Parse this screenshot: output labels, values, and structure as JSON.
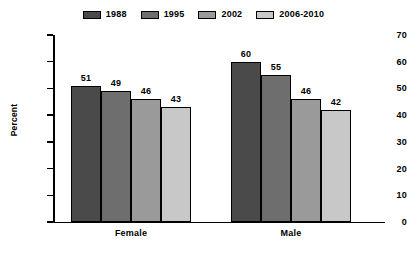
{
  "chart_data": {
    "type": "bar",
    "title": "",
    "xlabel": "",
    "ylabel": "Percent",
    "ylim": [
      0,
      70
    ],
    "ytick_step": 10,
    "yticks": [
      0,
      10,
      20,
      30,
      40,
      50,
      60,
      70
    ],
    "grid": false,
    "legend_position": "top-center",
    "categories": [
      "Female",
      "Male"
    ],
    "series": [
      {
        "name": "1988",
        "color": "#4a4a4a",
        "values": [
          51,
          60
        ]
      },
      {
        "name": "1995",
        "color": "#6e6e6e",
        "values": [
          49,
          55
        ]
      },
      {
        "name": "2002",
        "color": "#9a9a9a",
        "values": [
          46,
          46
        ]
      },
      {
        "name": "2006-2010",
        "color": "#c8c8c8",
        "values": [
          43,
          42
        ]
      }
    ]
  },
  "legend": {
    "items": [
      {
        "label": "1988"
      },
      {
        "label": "1995"
      },
      {
        "label": "2002"
      },
      {
        "label": "2006-2010"
      }
    ]
  },
  "axes": {
    "y_title": "Percent",
    "y_ticks": [
      "70",
      "60",
      "50",
      "40",
      "30",
      "20",
      "10",
      "0"
    ],
    "x_categories": [
      "Female",
      "Male"
    ]
  },
  "values": {
    "female": {
      "y1988": "51",
      "y1995": "49",
      "y2002": "46",
      "y2006_2010": "43"
    },
    "male": {
      "y1988": "60",
      "y1995": "55",
      "y2002": "46",
      "y2006_2010": "42"
    }
  }
}
